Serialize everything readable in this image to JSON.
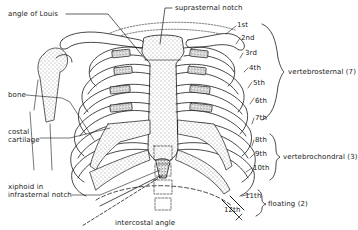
{
  "diagram": {
    "type": "anatomical-illustration",
    "labels": {
      "angle_of_louis": "angle of Louis",
      "suprasternal_notch": "suprasternal notch",
      "bone": "bone",
      "costal_cartilage_line1": "costal",
      "costal_cartilage_line2": "cartilage",
      "xiphoid_line1": "xiphoid in",
      "xiphoid_line2": "infrasternal notch",
      "intercostal_angle": "intercostal angle"
    },
    "ribs": [
      {
        "n": "1st"
      },
      {
        "n": "2nd"
      },
      {
        "n": "3rd"
      },
      {
        "n": "4th"
      },
      {
        "n": "5th"
      },
      {
        "n": "6th"
      },
      {
        "n": "7th"
      },
      {
        "n": "8th"
      },
      {
        "n": "9th"
      },
      {
        "n": "10th"
      },
      {
        "n": "11th"
      },
      {
        "n": "12th"
      }
    ],
    "groups": {
      "vertebrosternal": "vertebrosternal (7)",
      "vertebrochondral": "vertebrochondral (3)",
      "floating": "floating (2)"
    },
    "colors": {
      "ink": "#1a1a1a",
      "paper": "#ffffff"
    }
  }
}
